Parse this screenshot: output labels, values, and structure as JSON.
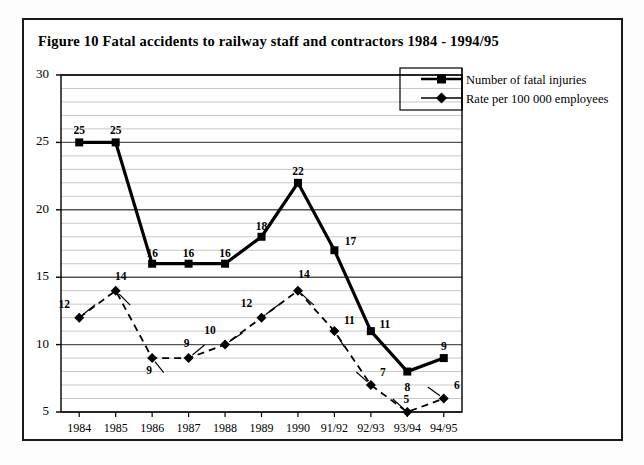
{
  "figure": {
    "title": "Figure 10  Fatal accidents to railway staff and contractors 1984 - 1994/95"
  },
  "legend": {
    "items": [
      {
        "label": "Number of fatal injuries",
        "marker": "square",
        "icon": "square-marker-icon"
      },
      {
        "label": "Rate per 100 000 employees",
        "marker": "diamond",
        "icon": "diamond-marker-icon"
      }
    ]
  },
  "axes": {
    "y_ticks": [
      "30",
      "25",
      "20",
      "15",
      "10",
      "5"
    ],
    "x_ticks": [
      "1984",
      "1985",
      "1986",
      "1987",
      "1988",
      "1989",
      "1990",
      "91/92",
      "92/93",
      "93/94",
      "94/95"
    ]
  },
  "chart_data": {
    "type": "line",
    "title": "Figure 10  Fatal accidents to railway staff and contractors 1984 - 1994/95",
    "xlabel": "",
    "ylabel": "",
    "ylim": [
      5,
      30
    ],
    "yticks": [
      5,
      10,
      15,
      20,
      25,
      30
    ],
    "minor_gridlines": true,
    "grid": true,
    "legend_position": "top-right",
    "categories": [
      "1984",
      "1985",
      "1986",
      "1987",
      "1988",
      "1989",
      "1990",
      "91/92",
      "92/93",
      "93/94",
      "94/95"
    ],
    "series": [
      {
        "name": "Number of fatal injuries",
        "marker": "square",
        "linestyle": "solid",
        "color": "#000000",
        "values": [
          25,
          25,
          16,
          16,
          16,
          18,
          22,
          17,
          11,
          8,
          9
        ],
        "data_labels": [
          "25",
          "25",
          "16",
          "16",
          "16",
          "18",
          "22",
          "17",
          "11",
          "8",
          "9"
        ]
      },
      {
        "name": "Rate per 100 000 employees",
        "marker": "diamond",
        "linestyle": "dashed",
        "color": "#000000",
        "values": [
          12,
          14,
          9,
          9,
          10,
          12,
          14,
          11,
          7,
          5,
          6
        ],
        "data_labels": [
          "12",
          "14",
          "9",
          "9",
          "10",
          "12",
          "14",
          "11",
          "7",
          "5",
          "6"
        ]
      }
    ]
  },
  "colors": {
    "frame": "#1a1a1a",
    "axis": "#000000",
    "gridline_major": "#555555",
    "gridline_minor": "#b9b9b9",
    "series": "#000000"
  }
}
